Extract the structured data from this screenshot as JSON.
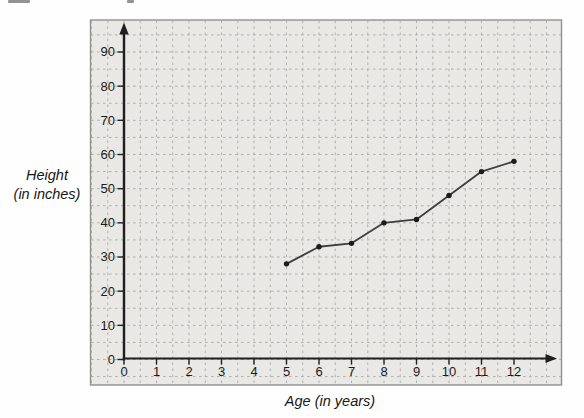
{
  "figure": {
    "y_axis_title": "Height\n(in inches)",
    "x_axis_title": "Age (in years)"
  },
  "chart_data": {
    "type": "line",
    "title": "",
    "xlabel": "Age (in years)",
    "ylabel": "Height (in inches)",
    "x_ticks": [
      "0",
      "1",
      "2",
      "3",
      "4",
      "5",
      "6",
      "7",
      "8",
      "9",
      "10",
      "11",
      "12"
    ],
    "y_ticks": [
      "0",
      "10",
      "20",
      "30",
      "40",
      "50",
      "60",
      "70",
      "80",
      "90"
    ],
    "xlim": [
      0,
      13.4
    ],
    "ylim": [
      0,
      99
    ],
    "grid": {
      "style": "dashed",
      "x_minor_step": 0.5,
      "y_minor_step": 5,
      "on": true
    },
    "legend": "none",
    "series": [
      {
        "name": "height",
        "x": [
          5,
          6,
          7,
          8,
          9,
          10,
          11,
          12
        ],
        "values": [
          28,
          33,
          34,
          40,
          41,
          48,
          55,
          58
        ]
      }
    ],
    "colors": {
      "panel": "#e9e8e5",
      "grid": "#a9a9a9",
      "axis": "#1f1f1f",
      "line": "#3d3d3d",
      "point": "#1c1c1c",
      "panel_border": "#909090"
    }
  }
}
